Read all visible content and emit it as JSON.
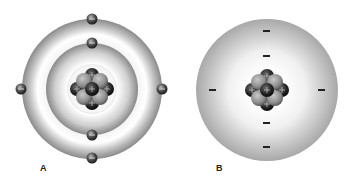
{
  "figure": {
    "panels": [
      {
        "label": "A",
        "model": "Bohr model (discrete electron shells)",
        "electrons_inner_shell": 2,
        "electrons_outer_shell": 4,
        "nucleus": "protons (+) and neutrons"
      },
      {
        "label": "B",
        "model": "Electron cloud model",
        "electron_marks": 6,
        "nucleus": "protons (+) and neutrons"
      }
    ],
    "colors": {
      "shell_dark": "#8a8a8a",
      "shell_light": "#ffffff",
      "electron": "#3a3a3a",
      "nucleus_light": "#8c8c8c",
      "nucleus_dark": "#1e1e1e"
    }
  }
}
